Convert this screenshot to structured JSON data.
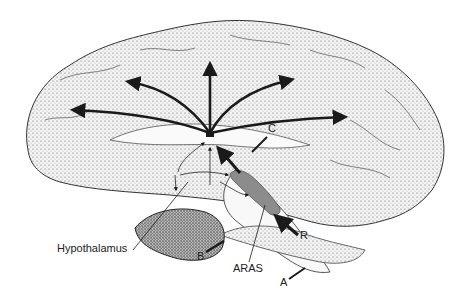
{
  "figure": {
    "type": "medial view of the brain (stippled illustration)",
    "labels": {
      "hypothalamus": "Hypothalamus",
      "b": "B",
      "aras": "ARAS",
      "a": "A",
      "r": "R",
      "c": "C"
    },
    "colors": {
      "ink": "#1a1a1a",
      "aras_fill": "#8c8c8c",
      "brain_fill": "#f1f1f1",
      "background": "#ffffff"
    },
    "arrows": {
      "origin": "thalamus",
      "count_radiating": 5
    }
  }
}
